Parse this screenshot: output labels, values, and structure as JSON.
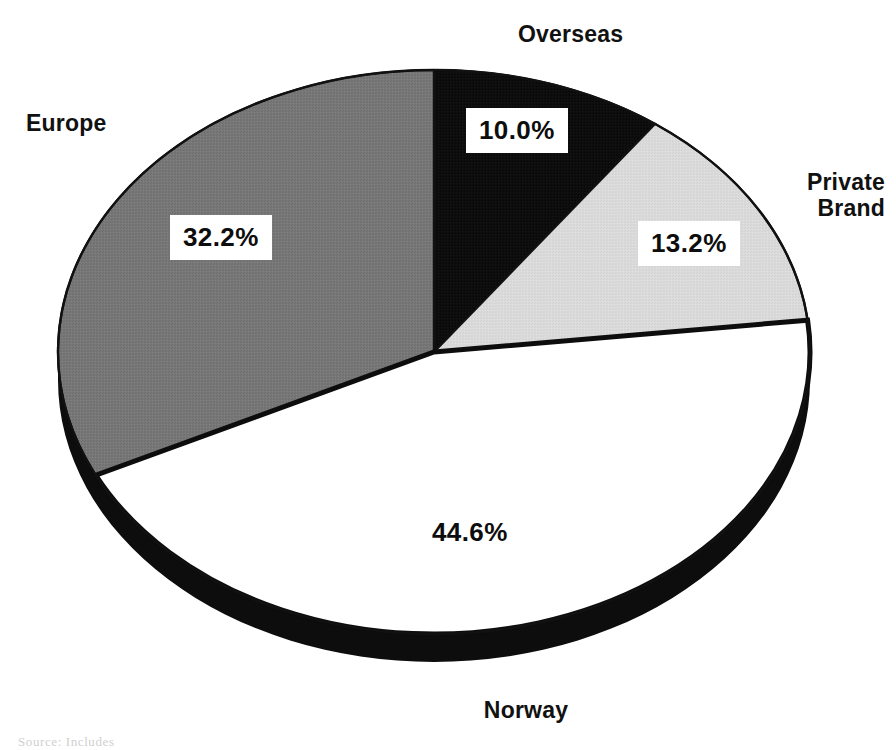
{
  "chart_data": {
    "type": "pie",
    "title": "",
    "subtitle": "",
    "xlabel": "",
    "ylabel": "",
    "grid": false,
    "legend_position": "none",
    "label_style": "outside-callout-with-boxed-percentages",
    "perspective": "3d-tilted-ellipse",
    "start_angle_deg": 0,
    "direction": "clockwise",
    "categories": [
      "Overseas",
      "Private Brand",
      "Norway",
      "Europe"
    ],
    "values": [
      10.0,
      13.2,
      44.6,
      32.2
    ],
    "value_labels": [
      "10.0%",
      "13.2%",
      "44.6%",
      "32.2%"
    ],
    "slice_colors": [
      "#0d0d0d",
      "#d9d9d9",
      "#ffffff",
      "#777777"
    ],
    "slices": [
      {
        "name": "Overseas",
        "value": 10.0,
        "value_label": "10.0%",
        "color": "#0d0d0d",
        "label_boxed": true
      },
      {
        "name": "Private Brand",
        "value": 13.2,
        "value_label": "13.2%",
        "color": "#d9d9d9",
        "label_boxed": true
      },
      {
        "name": "Norway",
        "value": 44.6,
        "value_label": "44.6%",
        "color": "#ffffff",
        "label_boxed": false
      },
      {
        "name": "Europe",
        "value": 32.2,
        "value_label": "32.2%",
        "color": "#777777",
        "label_boxed": true
      }
    ],
    "total": 100.0
  },
  "labels": {
    "overseas": "Overseas",
    "europe": "Europe",
    "private_brand": "Private\nBrand",
    "norway": "Norway"
  },
  "percentages": {
    "overseas": "10.0%",
    "private_brand": "13.2%",
    "norway": "44.6%",
    "europe": "32.2%"
  },
  "colors": {
    "slice_overseas": "#0d0d0d",
    "slice_private_brand": "#d9d9d9",
    "slice_norway": "#ffffff",
    "slice_europe": "#777777",
    "outline": "#111111",
    "rim_shadow": "#0d0d0d",
    "text": "#111111",
    "page_background": "#ffffff"
  },
  "footnote": {
    "text": "Source: Includes"
  }
}
